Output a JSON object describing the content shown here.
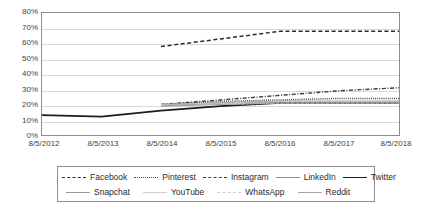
{
  "chart_data": {
    "type": "line",
    "title": "",
    "xlabel": "",
    "ylabel": "",
    "ylim": [
      0,
      80
    ],
    "yticks": [
      "0%",
      "10%",
      "20%",
      "30%",
      "40%",
      "50%",
      "60%",
      "70%",
      "80%"
    ],
    "ytick_values": [
      0,
      10,
      20,
      30,
      40,
      50,
      60,
      70,
      80
    ],
    "grid": true,
    "legend_position": "bottom",
    "x": [
      "8/5/2012",
      "8/5/2013",
      "8/5/2014",
      "8/5/2015",
      "8/5/2016",
      "8/5/2017",
      "8/5/2018"
    ],
    "x_values": [
      2012,
      2013,
      2014,
      2015,
      2016,
      2017,
      2018
    ],
    "series": [
      {
        "name": "Facebook",
        "style": "dashed",
        "color": "#2b2b2b",
        "x": [
          2014,
          2015,
          2016,
          2017,
          2018
        ],
        "values": [
          58,
          63,
          68,
          68,
          68
        ]
      },
      {
        "name": "Pinterest",
        "style": "dotted",
        "color": "#4a4a4a",
        "x": [
          2014,
          2015,
          2016,
          2017,
          2018
        ],
        "values": [
          20,
          22,
          23,
          24,
          24
        ]
      },
      {
        "name": "Instagram",
        "style": "dash-dot",
        "color": "#3a3a3a",
        "x": [
          2014,
          2015,
          2016,
          2017,
          2018
        ],
        "values": [
          20,
          23,
          26,
          29,
          31
        ]
      },
      {
        "name": "LinkedIn",
        "style": "solid-light",
        "color": "#8f8f8f",
        "x": [
          2014,
          2015,
          2016,
          2017,
          2018
        ],
        "values": [
          20,
          21,
          22,
          22,
          22
        ]
      },
      {
        "name": "Twitter",
        "style": "solid-dark",
        "color": "#1d1d1d",
        "x": [
          2012,
          2013,
          2014,
          2015,
          2016,
          2017,
          2018
        ],
        "values": [
          13,
          12,
          16,
          19,
          21,
          21,
          21
        ]
      },
      {
        "name": "Snapchat",
        "style": "solid-light",
        "color": "#9a9a9a",
        "x": [
          2014,
          2015,
          2016,
          2017,
          2018
        ],
        "values": [
          19,
          21,
          22,
          22,
          22
        ]
      },
      {
        "name": "YouTube",
        "style": "solid-faint",
        "color": "#c2c2c2",
        "x": [
          2014,
          2015,
          2016,
          2017,
          2018
        ],
        "values": [
          20,
          21,
          22,
          22,
          22
        ]
      },
      {
        "name": "WhatsApp",
        "style": "dashed-faint",
        "color": "#c8c8c8",
        "x": [
          2014,
          2015,
          2016,
          2017,
          2018
        ],
        "values": [
          19,
          20,
          21,
          21,
          21
        ]
      },
      {
        "name": "Reddit",
        "style": "solid-light",
        "color": "#a5a5a5",
        "x": [
          2014,
          2015,
          2016,
          2017,
          2018
        ],
        "values": [
          19,
          20,
          21,
          21,
          21
        ]
      }
    ]
  },
  "axis": {
    "yticks": [
      "80%",
      "70%",
      "60%",
      "50%",
      "40%",
      "30%",
      "20%",
      "10%",
      "0%"
    ],
    "xticks": [
      "8/5/2012",
      "8/5/2013",
      "8/5/2014",
      "8/5/2015",
      "8/5/2016",
      "8/5/2017",
      "8/5/2018"
    ]
  },
  "legend": {
    "row1": [
      {
        "label": "Facebook"
      },
      {
        "label": "Pinterest"
      },
      {
        "label": "Instagram"
      },
      {
        "label": "LinkedIn"
      },
      {
        "label": "Twitter"
      }
    ],
    "row2": [
      {
        "label": "Snapchat"
      },
      {
        "label": "YouTube"
      },
      {
        "label": "WhatsApp"
      },
      {
        "label": "Reddit"
      }
    ]
  }
}
